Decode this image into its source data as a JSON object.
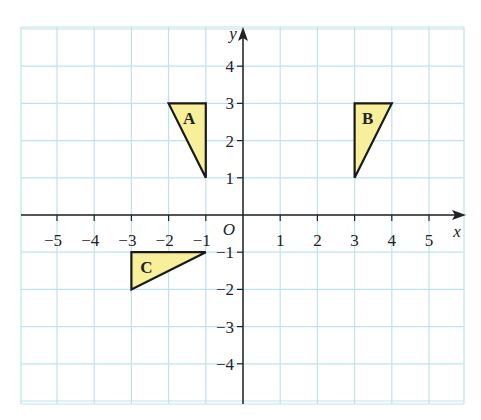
{
  "chart_data": {
    "type": "scatter",
    "title": "",
    "xlabel": "x",
    "ylabel": "y",
    "origin_label": "O",
    "xlim": [
      -6,
      6
    ],
    "ylim": [
      -5,
      5
    ],
    "grid": true,
    "x_ticks": [
      -5,
      -4,
      -3,
      -2,
      -1,
      1,
      2,
      3,
      4,
      5
    ],
    "y_ticks": [
      -4,
      -3,
      -2,
      -1,
      1,
      2,
      3,
      4
    ],
    "x_tick_labels": [
      "−5",
      "−4",
      "−3",
      "−2",
      "−1",
      "1",
      "2",
      "3",
      "4",
      "5"
    ],
    "y_tick_labels": [
      "−4",
      "−3",
      "−2",
      "−1",
      "1",
      "2",
      "3",
      "4"
    ],
    "shapes": [
      {
        "label": "A",
        "type": "triangle",
        "vertices": [
          [
            -2,
            3
          ],
          [
            -1,
            3
          ],
          [
            -1,
            1
          ]
        ],
        "label_pos": [
          -1.45,
          2.6
        ]
      },
      {
        "label": "B",
        "type": "triangle",
        "vertices": [
          [
            3,
            3
          ],
          [
            4,
            3
          ],
          [
            3,
            1
          ]
        ],
        "label_pos": [
          3.35,
          2.6
        ]
      },
      {
        "label": "C",
        "type": "triangle",
        "vertices": [
          [
            -3,
            -1
          ],
          [
            -1,
            -1
          ],
          [
            -3,
            -2
          ]
        ],
        "label_pos": [
          -2.6,
          -1.4
        ]
      }
    ]
  },
  "colors": {
    "grid": "#bfe3ee",
    "axis": "#222222",
    "shape_fill": "#f8ef9b",
    "shape_stroke": "#1a1a1a",
    "text": "#222222"
  }
}
